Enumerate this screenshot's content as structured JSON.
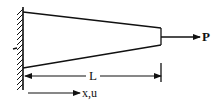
{
  "diagram": {
    "type": "tapered-bar-axial-load",
    "labels": {
      "force": "P",
      "length": "L",
      "axis": "x,u"
    },
    "colors": {
      "stroke": "#111111",
      "background": "#ffffff"
    },
    "elements": {
      "wall": {
        "x": 23,
        "y_top": 7,
        "y_bottom": 90,
        "hatch": "left"
      },
      "bar": {
        "left_top": [
          23,
          12
        ],
        "left_bottom": [
          23,
          68
        ],
        "right_top": [
          161,
          28
        ],
        "right_bottom": [
          161,
          45
        ]
      },
      "force_arrow": {
        "from": [
          161,
          37
        ],
        "to": [
          200,
          37
        ]
      },
      "length_dimension": {
        "from": [
          25,
          76
        ],
        "to": [
          161,
          76
        ],
        "tick_x": 161
      },
      "axis_arrow": {
        "from": [
          28,
          93
        ],
        "to": [
          80,
          93
        ]
      }
    }
  }
}
